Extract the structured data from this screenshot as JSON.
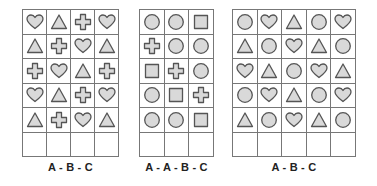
{
  "colors": {
    "fill": "#d9d9d9",
    "stroke": "#555555",
    "grid": "#777777"
  },
  "grids": [
    {
      "caption": "A - B - C",
      "left": 22,
      "width": 97,
      "cols": 4,
      "rows": [
        [
          "heart",
          "triangle",
          "cross",
          "heart"
        ],
        [
          "triangle",
          "cross",
          "heart",
          "triangle"
        ],
        [
          "cross",
          "heart",
          "triangle",
          "cross"
        ],
        [
          "heart",
          "triangle",
          "cross",
          "heart"
        ],
        [
          "triangle",
          "cross",
          "heart",
          "triangle"
        ],
        [
          "",
          "",
          "",
          ""
        ]
      ]
    },
    {
      "caption": "A - A - B - C",
      "left": 139,
      "width": 75,
      "cols": 3,
      "rows": [
        [
          "circle",
          "circle",
          "square"
        ],
        [
          "cross",
          "circle",
          "circle"
        ],
        [
          "square",
          "cross",
          "circle"
        ],
        [
          "circle",
          "square",
          "cross"
        ],
        [
          "circle",
          "circle",
          "square"
        ],
        [
          "",
          "",
          ""
        ]
      ]
    },
    {
      "caption": "A - B - C",
      "left": 232,
      "width": 124,
      "cols": 5,
      "rows": [
        [
          "circle",
          "heart",
          "triangle",
          "circle",
          "heart"
        ],
        [
          "triangle",
          "circle",
          "heart",
          "triangle",
          "circle"
        ],
        [
          "heart",
          "triangle",
          "circle",
          "heart",
          "triangle"
        ],
        [
          "circle",
          "heart",
          "triangle",
          "circle",
          "heart"
        ],
        [
          "triangle",
          "circle",
          "heart",
          "triangle",
          "circle"
        ],
        [
          "",
          "",
          "",
          "",
          ""
        ]
      ]
    }
  ]
}
